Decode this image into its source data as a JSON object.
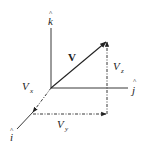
{
  "diagram": {
    "title": "",
    "axes": {
      "k": {
        "label": "k",
        "hat": "^"
      },
      "j": {
        "label": "j",
        "hat": "^"
      },
      "i": {
        "label": "i",
        "hat": "^"
      }
    },
    "vector": {
      "label": "V"
    },
    "components": {
      "x": {
        "label": "V",
        "subscript": "x"
      },
      "y": {
        "label": "V",
        "subscript": "y"
      },
      "z": {
        "label": "V",
        "subscript": "z"
      }
    },
    "colors": {
      "line": "#222222",
      "background": "#ffffff"
    }
  }
}
